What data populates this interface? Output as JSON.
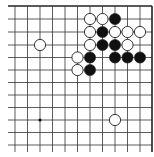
{
  "diagram": {
    "type": "go-board-partial",
    "view": "top-right corner",
    "columns_x": [
      15,
      27.5,
      40,
      52.5,
      65,
      77.5,
      90,
      102.5,
      115,
      127.5,
      140,
      152
    ],
    "rows_y": [
      6,
      19,
      32,
      45,
      57.5,
      70,
      82.5,
      95,
      107.5,
      120,
      132.5,
      145
    ],
    "line_extend": {
      "left": 8,
      "bottom": 152
    },
    "edges": {
      "top": true,
      "right": true,
      "left": false,
      "bottom": false
    },
    "star_points": [
      {
        "col": 2,
        "row": 9
      }
    ],
    "stone_radius": 5.6,
    "colors": {
      "line": "#333333",
      "edge": "#222222",
      "black": "#111111",
      "white": "#ffffff",
      "stone_outline": "#222222"
    },
    "stones": [
      {
        "color": "white",
        "col": 6,
        "row": 1
      },
      {
        "color": "white",
        "col": 7,
        "row": 1
      },
      {
        "color": "black",
        "col": 8,
        "row": 1
      },
      {
        "color": "white",
        "col": 6,
        "row": 2
      },
      {
        "color": "black",
        "col": 7,
        "row": 2
      },
      {
        "color": "white",
        "col": 8,
        "row": 2
      },
      {
        "color": "white",
        "col": 9,
        "row": 2
      },
      {
        "color": "white",
        "col": 10,
        "row": 2
      },
      {
        "color": "white",
        "col": 2,
        "row": 3
      },
      {
        "color": "white",
        "col": 6,
        "row": 3
      },
      {
        "color": "black",
        "col": 7,
        "row": 3
      },
      {
        "color": "black",
        "col": 8,
        "row": 3
      },
      {
        "color": "white",
        "col": 9,
        "row": 3
      },
      {
        "color": "white",
        "col": 5,
        "row": 4
      },
      {
        "color": "black",
        "col": 6,
        "row": 4
      },
      {
        "color": "black",
        "col": 8,
        "row": 4
      },
      {
        "color": "black",
        "col": 9,
        "row": 4
      },
      {
        "color": "black",
        "col": 10,
        "row": 4
      },
      {
        "color": "white",
        "col": 5,
        "row": 5
      },
      {
        "color": "black",
        "col": 6,
        "row": 5
      },
      {
        "color": "white",
        "col": 8,
        "row": 9
      }
    ]
  }
}
